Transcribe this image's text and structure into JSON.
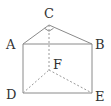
{
  "diagram": {
    "type": "triangular-prism",
    "colors": {
      "edge": "#8a8a8a",
      "label": "#333333",
      "background": "#ffffff"
    },
    "vertices": {
      "A": {
        "label": "A",
        "x": 23,
        "y": 44,
        "lx": 6,
        "ly": 49
      },
      "B": {
        "label": "B",
        "x": 92,
        "y": 44,
        "lx": 95,
        "ly": 49
      },
      "C": {
        "label": "C",
        "x": 49,
        "y": 25,
        "lx": 44,
        "ly": 18
      },
      "D": {
        "label": "D",
        "x": 23,
        "y": 93,
        "lx": 6,
        "ly": 99
      },
      "E": {
        "label": "E",
        "x": 92,
        "y": 93,
        "lx": 95,
        "ly": 101
      },
      "F": {
        "label": "F",
        "x": 49,
        "y": 70,
        "lx": 53,
        "ly": 69
      }
    },
    "visible_edges": [
      "AB",
      "AC",
      "CB",
      "AD",
      "BE",
      "DE"
    ],
    "hidden_edges": [
      "CF",
      "DF",
      "FE"
    ],
    "right_angle_at": "C"
  }
}
